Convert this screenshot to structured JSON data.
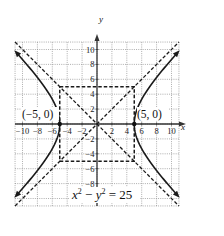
{
  "chart_data": {
    "type": "line",
    "title": "",
    "equation": "x² − y² = 25",
    "equation_parts": {
      "x": "x",
      "exp1": "2",
      "minus": " − ",
      "y": "y",
      "exp2": "2",
      "rhs": " = 25"
    },
    "xlabel": "x",
    "ylabel": "y",
    "xlim": [
      -11,
      11
    ],
    "ylim": [
      -11,
      11
    ],
    "grid": true,
    "x_ticks": [
      -10,
      -8,
      -6,
      -4,
      -2,
      2,
      4,
      6,
      8,
      10
    ],
    "y_ticks": [
      10,
      8,
      6,
      4,
      2,
      -2,
      -4,
      -6,
      -8
    ],
    "x_tick_labels": [
      "−10",
      "−8",
      "−6",
      "−4",
      "−2",
      "2",
      "4",
      "6",
      "8",
      "10"
    ],
    "y_tick_labels": [
      "10",
      "8",
      "6",
      "4",
      "2",
      "−2",
      "−4",
      "−6",
      "−8"
    ],
    "series": [
      {
        "name": "hyperbola right branch",
        "style": "solid",
        "equation": "x = sqrt(25 + y^2), x > 0",
        "vertex": [
          5,
          0
        ]
      },
      {
        "name": "hyperbola left branch",
        "style": "solid",
        "equation": "x = -sqrt(25 + y^2), x < 0",
        "vertex": [
          -5,
          0
        ]
      },
      {
        "name": "asymptote y = x",
        "style": "dashed",
        "slope": 1
      },
      {
        "name": "asymptote y = -x",
        "style": "dashed",
        "slope": -1
      },
      {
        "name": "fundamental rectangle",
        "style": "dashed",
        "corners": [
          [
            -5,
            5
          ],
          [
            5,
            5
          ],
          [
            5,
            -5
          ],
          [
            -5,
            -5
          ]
        ]
      }
    ],
    "annotations": [
      {
        "text": "(−5, 0)",
        "point": [
          -5,
          0
        ]
      },
      {
        "text": "(5, 0)",
        "point": [
          5,
          0
        ]
      }
    ],
    "colors": {
      "curve": "#1a1a1a",
      "grid": "#8a8a8a",
      "axis": "#333333",
      "background": "#ffffff"
    }
  }
}
